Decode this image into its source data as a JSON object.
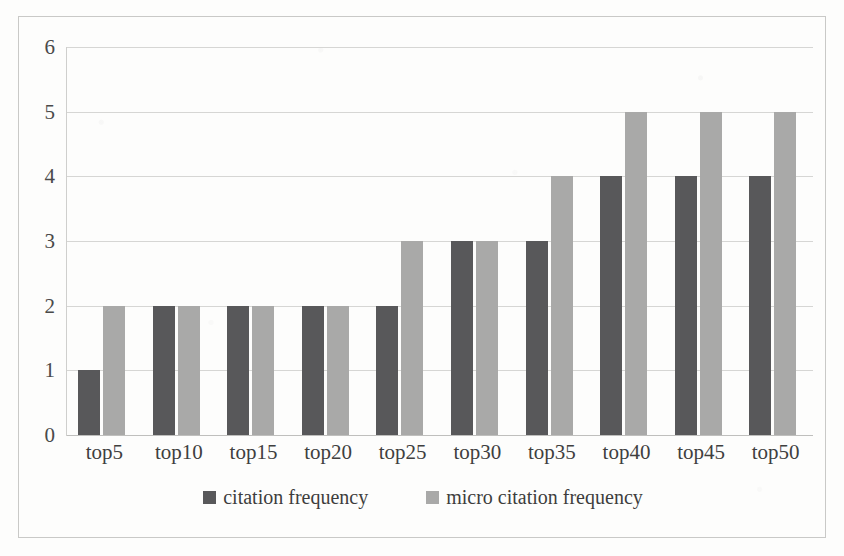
{
  "chart_data": {
    "type": "bar",
    "title": "",
    "subtitle": "",
    "xlabel": "",
    "ylabel": "",
    "categories": [
      "top5",
      "top10",
      "top15",
      "top20",
      "top25",
      "top30",
      "top35",
      "top40",
      "top45",
      "top50"
    ],
    "series": [
      {
        "name": "citation frequency",
        "color": "#58585a",
        "values": [
          1,
          2,
          2,
          2,
          2,
          3,
          3,
          4,
          4,
          4
        ]
      },
      {
        "name": "micro citation frequency",
        "color": "#a9a9a8",
        "values": [
          2,
          2,
          2,
          2,
          3,
          3,
          4,
          5,
          5,
          5
        ]
      }
    ],
    "ylim": [
      0,
      6
    ],
    "ytick_labels": [
      "6",
      "5",
      "4",
      "3",
      "2",
      "1",
      "0"
    ],
    "ytick_values": [
      6,
      5,
      4,
      3,
      2,
      1,
      0
    ],
    "grid": true,
    "grid_axis": "y",
    "legend_position": "bottom",
    "legend_entries": [
      "citation frequency",
      "micro citation frequency"
    ]
  },
  "frame": {
    "border_color": "#c9c9c7",
    "gridline_color": "#d6d6d4",
    "background": "#fdfdfc"
  }
}
